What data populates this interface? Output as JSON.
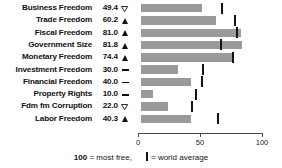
{
  "chart_data": {
    "type": "bar",
    "title": "",
    "xlabel": "",
    "ylabel": "",
    "xlim": [
      0,
      100
    ],
    "grid": false,
    "orientation": "horizontal",
    "categories": [
      "Business Freedom",
      "Trade Freedom",
      "Fiscal Freedom",
      "Government Size",
      "Monetary Freedom",
      "Investment Freedom",
      "Financial Freedom",
      "Property Rights",
      "Fdm fm Corruption",
      "Labor Freedom"
    ],
    "values": [
      49.4,
      60.2,
      81.0,
      81.8,
      74.4,
      30.0,
      40.0,
      10.0,
      22.0,
      40.3
    ],
    "value_labels": [
      "49.4",
      "60.2",
      "81.0",
      "81.8",
      "74.4",
      "30.0",
      "40.0",
      "10.0",
      "22.0",
      "40.3"
    ],
    "trend_markers": [
      "down",
      "up",
      "up",
      "up",
      "up",
      "flat",
      "flat",
      "flat",
      "down",
      "up"
    ],
    "world_average": [
      64.3,
      74.8,
      76.3,
      63.6,
      73.4,
      49.0,
      48.5,
      43.6,
      40.2,
      61.5
    ],
    "series": [
      {
        "name": "score",
        "values": [
          49.4,
          60.2,
          81.0,
          81.8,
          74.4,
          30.0,
          40.0,
          10.0,
          22.0,
          40.3
        ]
      },
      {
        "name": "world average",
        "values": [
          64.3,
          74.8,
          76.3,
          63.6,
          73.4,
          49.0,
          48.5,
          43.6,
          40.2,
          61.5
        ]
      }
    ],
    "xticks": [
      0,
      50,
      100
    ],
    "xtick_labels": [
      "0",
      "50",
      "100"
    ],
    "legend": [
      {
        "text_bold": "100",
        "text": " = most free,"
      },
      {
        "marker": "world-average-tick",
        "text": "= world average"
      }
    ],
    "colors": {
      "bar": "#9a9a9a",
      "average_tick": "#141414",
      "axis": "#4a4a4a",
      "text": "#111111"
    }
  },
  "legend": {
    "most_free_value": "100",
    "most_free_text": "= most free,",
    "world_average_text": "= world average"
  }
}
